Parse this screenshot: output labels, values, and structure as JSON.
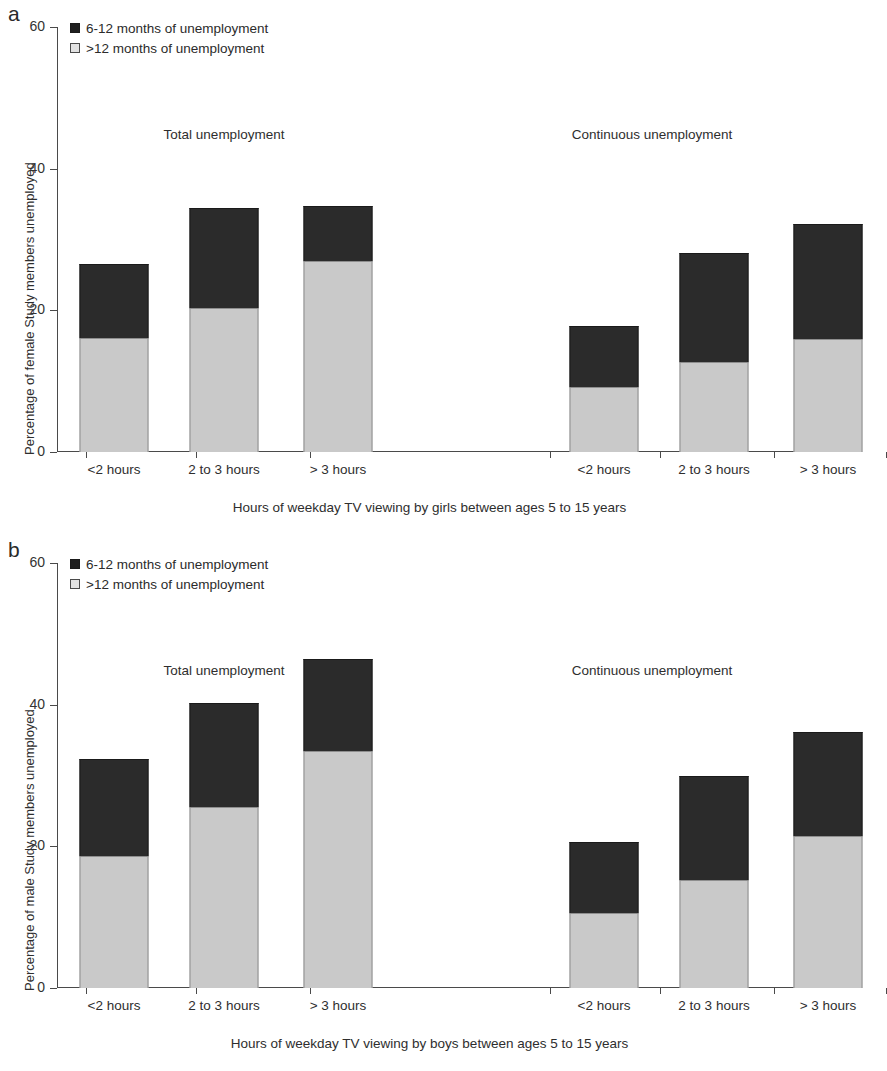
{
  "figure": {
    "panels": [
      {
        "letter": "a",
        "ylabel": "Percentage of female Study members unemployed",
        "xlabel": "Hours of weekday TV viewing by girls between ages 5 to 15 years",
        "legend": [
          {
            "label": "6-12 months of unemployment",
            "swatch": "dark"
          },
          {
            "label": ">12 months of unemployment",
            "swatch": "light"
          }
        ],
        "group_headers": [
          "Total unemployment",
          "Continuous unemployment"
        ],
        "yticks": [
          "0",
          "20",
          "40",
          "60"
        ],
        "xticklabels": [
          "<2 hours",
          "2 to 3 hours",
          "> 3 hours",
          "<2 hours",
          "2 to 3 hours",
          "> 3 hours"
        ]
      },
      {
        "letter": "b",
        "ylabel": "Percentage of male Study members unemployed",
        "xlabel": "Hours of weekday TV viewing by boys between ages 5 to 15 years",
        "legend": [
          {
            "label": "6-12 months of unemployment",
            "swatch": "dark"
          },
          {
            "label": ">12 months of unemployment",
            "swatch": "light"
          }
        ],
        "group_headers": [
          "Total unemployment",
          "Continuous unemployment"
        ],
        "yticks": [
          "0",
          "20",
          "40",
          "60"
        ],
        "xticklabels": [
          "<2 hours",
          "2 to 3 hours",
          "> 3 hours",
          "<2 hours",
          "2 to 3 hours",
          "> 3 hours"
        ]
      }
    ]
  },
  "chart_data": [
    {
      "type": "bar",
      "stacked": true,
      "panel": "a",
      "title": "",
      "xlabel": "Hours of weekday TV viewing by girls between ages 5 to 15 years",
      "ylabel": "Percentage of female Study members unemployed",
      "ylim": [
        0,
        60
      ],
      "yticks": [
        0,
        20,
        40,
        60
      ],
      "grid": false,
      "legend_position": "top-left",
      "groups": [
        "Total unemployment",
        "Continuous unemployment"
      ],
      "categories": [
        "<2 hours",
        "2 to 3 hours",
        "> 3 hours",
        "<2 hours",
        "2 to 3 hours",
        "> 3 hours"
      ],
      "series": [
        {
          "name": ">12 months of unemployment",
          "color": "#c9c9c9",
          "values": [
            16.1,
            20.4,
            27.0,
            9.2,
            12.7,
            16.0
          ]
        },
        {
          "name": "6-12 months of unemployment",
          "color": "#2b2b2b",
          "values": [
            10.5,
            14.1,
            7.7,
            8.6,
            15.4,
            16.2
          ]
        }
      ],
      "totals": [
        26.6,
        34.5,
        34.7,
        17.8,
        28.1,
        32.2
      ]
    },
    {
      "type": "bar",
      "stacked": true,
      "panel": "b",
      "title": "",
      "xlabel": "Hours of weekday TV viewing by boys between ages 5 to 15 years",
      "ylabel": "Percentage of male Study members unemployed",
      "ylim": [
        0,
        60
      ],
      "yticks": [
        0,
        20,
        40,
        60
      ],
      "grid": false,
      "legend_position": "top-left",
      "groups": [
        "Total unemployment",
        "Continuous unemployment"
      ],
      "categories": [
        "<2 hours",
        "2 to 3 hours",
        "> 3 hours",
        "<2 hours",
        "2 to 3 hours",
        "> 3 hours"
      ],
      "series": [
        {
          "name": ">12 months of unemployment",
          "color": "#c9c9c9",
          "values": [
            18.6,
            25.6,
            33.5,
            10.6,
            15.2,
            21.4
          ]
        },
        {
          "name": "6-12 months of unemployment",
          "color": "#2b2b2b",
          "values": [
            13.8,
            14.7,
            12.9,
            10.0,
            14.7,
            14.8
          ]
        }
      ],
      "totals": [
        32.4,
        40.3,
        46.4,
        20.6,
        29.9,
        36.2
      ]
    }
  ]
}
